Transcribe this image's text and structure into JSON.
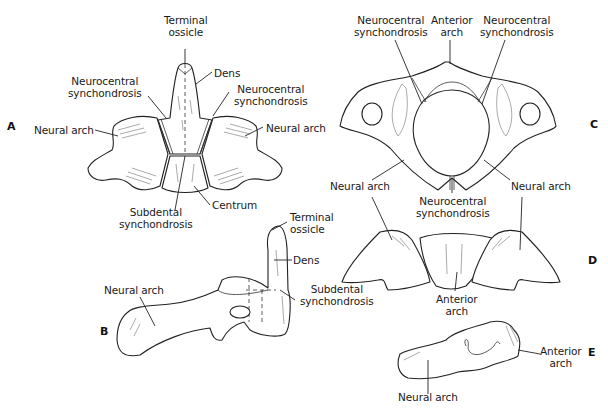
{
  "figure": {
    "panels": [
      {
        "id": "A",
        "label": "A",
        "labels": {
          "terminal_ossicle": "Terminal\nossicle",
          "dens": "Dens",
          "neurocentral_left": "Neurocentral\nsynchondrosis",
          "neurocentral_right": "Neurocentral\nsynchondrosis",
          "neural_arch_left": "Neural arch",
          "neural_arch_right": "Neural arch",
          "subdental": "Subdental\nsynchondrosis",
          "centrum": "Centrum"
        }
      },
      {
        "id": "B",
        "label": "B",
        "labels": {
          "terminal_ossicle": "Terminal\nossicle",
          "dens": "Dens",
          "neural_arch": "Neural arch",
          "subdental": "Subdental\nsynchondrosis"
        }
      },
      {
        "id": "C",
        "label": "C",
        "labels": {
          "neurocentral_left": "Neurocentral\nsynchondrosis",
          "anterior_arch": "Anterior\narch",
          "neurocentral_right": "Neurocentral\nsynchondrosis",
          "neural_arch_left": "Neural arch",
          "neural_arch_right": "Neural arch",
          "neurocentral_bottom": "Neurocentral\nsynchondrosis"
        }
      },
      {
        "id": "D",
        "label": "D",
        "labels": {
          "anterior_arch": "Anterior\narch"
        }
      },
      {
        "id": "E",
        "label": "E",
        "labels": {
          "anterior_arch": "Anterior\narch",
          "neural_arch": "Neural arch"
        }
      }
    ]
  }
}
